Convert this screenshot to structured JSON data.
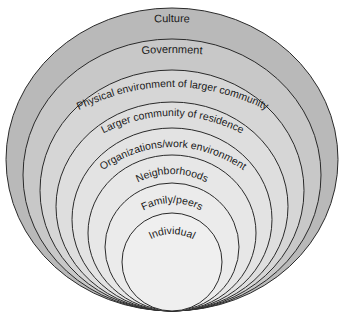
{
  "diagram": {
    "type": "nested-ellipses",
    "layers": [
      {
        "label": "Culture",
        "fill": "#b9b9b9"
      },
      {
        "label": "Government",
        "fill": "#c8c8c8"
      },
      {
        "label": "Physical environment of larger community",
        "fill": "#d6d6d6"
      },
      {
        "label": "Larger community of residence",
        "fill": "#dedede"
      },
      {
        "label": "Organizations/work environment",
        "fill": "#e3e3e3"
      },
      {
        "label": "Neighborhoods",
        "fill": "#e7e7e7"
      },
      {
        "label": "Family/peers",
        "fill": "#ebebeb"
      },
      {
        "label": "Individual",
        "fill": "#efefef"
      }
    ],
    "stroke": "#2a2a2a"
  }
}
